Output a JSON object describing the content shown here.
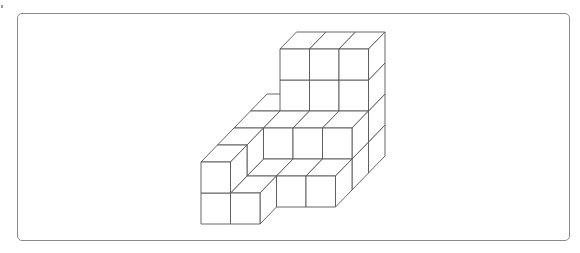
{
  "figure": {
    "stroke_color": "#555555",
    "face_fill": "#ffffff",
    "frame_color": "#8a8a8a",
    "projection": {
      "origin": [
        201,
        224
      ],
      "unit_x": [
        29.5,
        0
      ],
      "unit_up": [
        0,
        -31
      ],
      "unit_depth": [
        16.5,
        -17
      ]
    },
    "voxels": [
      [
        0,
        0,
        0
      ],
      [
        0,
        1,
        0
      ],
      [
        1,
        0,
        0
      ],
      [
        0,
        0,
        1
      ],
      [
        0,
        1,
        1
      ],
      [
        1,
        0,
        1
      ],
      [
        2,
        0,
        1
      ],
      [
        3,
        0,
        1
      ],
      [
        0,
        0,
        2
      ],
      [
        0,
        1,
        2
      ],
      [
        1,
        0,
        2
      ],
      [
        1,
        1,
        2
      ],
      [
        2,
        0,
        2
      ],
      [
        2,
        1,
        2
      ],
      [
        3,
        0,
        2
      ],
      [
        3,
        1,
        2
      ],
      [
        0,
        0,
        3
      ],
      [
        0,
        1,
        3
      ],
      [
        1,
        0,
        3
      ],
      [
        1,
        1,
        3
      ],
      [
        1,
        2,
        3
      ],
      [
        1,
        3,
        3
      ],
      [
        2,
        0,
        3
      ],
      [
        2,
        1,
        3
      ],
      [
        2,
        2,
        3
      ],
      [
        2,
        3,
        3
      ],
      [
        3,
        0,
        3
      ],
      [
        3,
        1,
        3
      ],
      [
        3,
        2,
        3
      ],
      [
        3,
        3,
        3
      ]
    ]
  }
}
